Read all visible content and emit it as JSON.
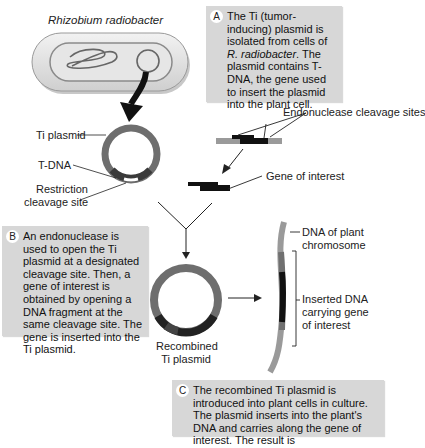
{
  "organism": {
    "name": "Rhizobium radiobacter"
  },
  "steps": [
    {
      "letter": "A",
      "text_pre": "The Ti (tumor-inducing) plasmid is isolated from cells of ",
      "text_italic": "R. radiobacter",
      "text_post": ". The plasmid contains T-DNA, the gene used to insert the plasmid into the plant cell."
    },
    {
      "letter": "B",
      "text": "An endonuclease is used to open the Ti plasmid at a designated cleavage site. Then, a gene of interest is obtained by opening a DNA fragment at the same cleavage site. The gene is inserted into the Ti plasmid."
    },
    {
      "letter": "C",
      "text": "The recombined Ti plasmid is introduced into plant cells in culture. The plasmid inserts into the plant's DNA and carries along the gene of interest. The result is"
    }
  ],
  "labels": {
    "ti_plasmid": "Ti plasmid",
    "t_dna": "T-DNA",
    "restriction_site_1": "Restriction",
    "restriction_site_2": "cleavage site",
    "endonuclease_sites": "Endonuclease cleavage sites",
    "gene_of_interest": "Gene of interest",
    "recombined_1": "Recombined",
    "recombined_2": "Ti plasmid",
    "plant_dna_1": "DNA of plant",
    "plant_dna_2": "chromosome",
    "inserted_1": "Inserted DNA",
    "inserted_2": "carrying gene",
    "inserted_3": "of interest"
  },
  "colors": {
    "box_bg": "#d7d7d7",
    "plasmid": "#707070",
    "dna_gray": "#9a9a9a",
    "gene": "#111111"
  }
}
